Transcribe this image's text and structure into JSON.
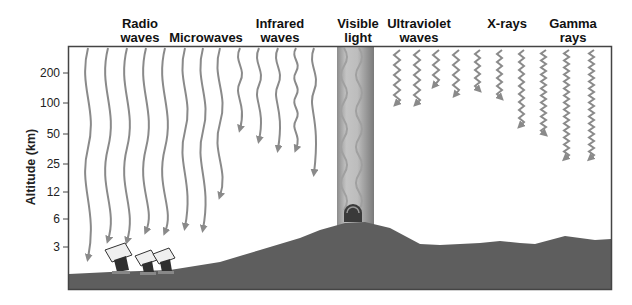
{
  "diagram": {
    "yaxis": {
      "title": "Altitude (km)",
      "ticks": [
        {
          "label": "200",
          "y": 73
        },
        {
          "label": "100",
          "y": 103
        },
        {
          "label": "50",
          "y": 134
        },
        {
          "label": "25",
          "y": 164
        },
        {
          "label": "12",
          "y": 192
        },
        {
          "label": "6",
          "y": 219
        },
        {
          "label": "3",
          "y": 247
        }
      ]
    },
    "bands": [
      {
        "id": "radio",
        "line1": "Radio",
        "line2": "waves",
        "x": 140
      },
      {
        "id": "microwaves",
        "line1": "",
        "line2": "Microwaves",
        "x": 206
      },
      {
        "id": "infrared",
        "line1": "Infrared",
        "line2": "waves",
        "x": 280
      },
      {
        "id": "visible",
        "line1": "Visible",
        "line2": "light",
        "x": 358
      },
      {
        "id": "ultraviolet",
        "line1": "Ultraviolet",
        "line2": "waves",
        "x": 419
      },
      {
        "id": "xrays",
        "line1": "X-rays",
        "line2": "",
        "x": 507
      },
      {
        "id": "gamma",
        "line1": "Gamma",
        "line2": "rays",
        "x": 573
      }
    ],
    "colors": {
      "wave": "#8a8a8a",
      "ground": "#5e5e5e",
      "frame": "#444444",
      "visible_column": "#9a9a9a"
    }
  }
}
